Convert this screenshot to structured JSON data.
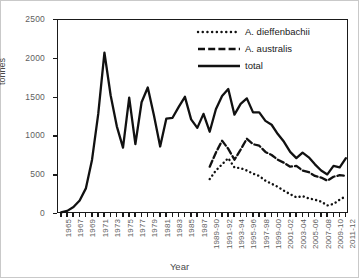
{
  "chart_data": {
    "type": "line",
    "title": "",
    "xlabel": "Year",
    "ylabel": "tonnes",
    "ylim": [
      0,
      2500
    ],
    "yticks": [
      0,
      500,
      1000,
      1500,
      2000,
      2500
    ],
    "grid": false,
    "legend_position": "top-right",
    "x_tick_label_rotation": -90,
    "categories": [
      "1965",
      "1966",
      "1967",
      "1968",
      "1969",
      "1970",
      "1971",
      "1972",
      "1973",
      "1974",
      "1975",
      "1976",
      "1977",
      "1978",
      "1979",
      "1980",
      "1981",
      "1982",
      "1983",
      "1984",
      "1985",
      "1986",
      "1987",
      "1988-89",
      "1989-90",
      "1990-91",
      "1991-92",
      "1992-93",
      "1993-94",
      "1994-95",
      "1995-96",
      "1996-97",
      "1997-98",
      "1998-99",
      "1999-00",
      "2000-01",
      "2001-02",
      "2002-03",
      "2003-04",
      "2004-05",
      "2005-06",
      "2006-07",
      "2007-08",
      "2008-09",
      "2009-10",
      "2010-11",
      "2011-12"
    ],
    "xtick_labels": [
      "1965",
      "1967",
      "1969",
      "1971",
      "1973",
      "1975",
      "1977",
      "1979",
      "1981",
      "1983",
      "1985",
      "1987",
      "1989-90",
      "1991-92",
      "1993-94",
      "1995-96",
      "1997-98",
      "1999-00",
      "2001-02",
      "2003-04",
      "2005-06",
      "2007-08",
      "2009-10",
      "2011-12"
    ],
    "series": [
      {
        "name": "A. dieffenbachii",
        "style": "dotted",
        "color": "#111111",
        "start_index": 24,
        "values": [
          null,
          null,
          null,
          null,
          null,
          null,
          null,
          null,
          null,
          null,
          null,
          null,
          null,
          null,
          null,
          null,
          null,
          null,
          null,
          null,
          null,
          null,
          null,
          null,
          450,
          560,
          640,
          720,
          600,
          590,
          560,
          520,
          490,
          430,
          390,
          350,
          300,
          255,
          215,
          230,
          200,
          185,
          160,
          110,
          130,
          185,
          230
        ]
      },
      {
        "name": "A. australis",
        "style": "dashed",
        "color": "#111111",
        "start_index": 24,
        "values": [
          null,
          null,
          null,
          null,
          null,
          null,
          null,
          null,
          null,
          null,
          null,
          null,
          null,
          null,
          null,
          null,
          null,
          null,
          null,
          null,
          null,
          null,
          null,
          null,
          610,
          790,
          945,
          840,
          700,
          830,
          970,
          900,
          880,
          800,
          760,
          700,
          660,
          610,
          620,
          560,
          540,
          490,
          470,
          430,
          480,
          500,
          490
        ]
      },
      {
        "name": "total",
        "style": "solid",
        "color": "#111111",
        "start_index": 0,
        "values": [
          20,
          40,
          90,
          175,
          330,
          700,
          1290,
          2080,
          1530,
          1130,
          855,
          1500,
          900,
          1440,
          1630,
          1270,
          870,
          1230,
          1240,
          1380,
          1510,
          1220,
          1110,
          1290,
          1060,
          1350,
          1520,
          1610,
          1280,
          1420,
          1490,
          1310,
          1310,
          1200,
          1150,
          1030,
          930,
          800,
          720,
          790,
          730,
          640,
          560,
          510,
          620,
          600,
          720
        ]
      }
    ]
  },
  "legend": {
    "items": [
      {
        "label": "A. dieffenbachii",
        "style": "dotted"
      },
      {
        "label": "A. australis",
        "style": "dashed"
      },
      {
        "label": "total",
        "style": "solid"
      }
    ]
  }
}
